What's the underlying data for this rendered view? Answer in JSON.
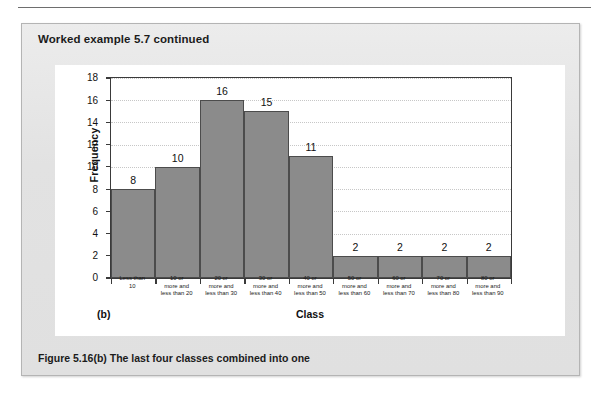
{
  "page": {
    "example_title": "Worked example 5.7 continued",
    "caption": "Figure 5.16(b)  The last four classes combined into one",
    "panel_letter": "(b)"
  },
  "chart_data": {
    "type": "bar",
    "title": "",
    "xlabel": "Class",
    "ylabel": "Frequency",
    "ylim": [
      0,
      18
    ],
    "yticks": [
      0,
      2,
      4,
      6,
      8,
      10,
      12,
      14,
      16,
      18
    ],
    "grid": true,
    "legend": "none",
    "categories": [
      "Less than\n10",
      "10 or\nmore and\nless than 20",
      "20 or\nmore and\nless than 30",
      "30 or\nmore and\nless than 40",
      "40 or\nmore and\nless than 50",
      "50 or\nmore and\nless than 60",
      "60 or\nmore and\nless than 70",
      "70 or\nmore and\nless than 80",
      "80 or\nmore and\nless than 90"
    ],
    "category_lines": [
      [
        "Less than",
        "10"
      ],
      [
        "10 or",
        "more and",
        "less than 20"
      ],
      [
        "20 or",
        "more and",
        "less than 30"
      ],
      [
        "30 or",
        "more and",
        "less than 40"
      ],
      [
        "40 or",
        "more and",
        "less than 50"
      ],
      [
        "50 or",
        "more and",
        "less than 60"
      ],
      [
        "60 or",
        "more and",
        "less than 70"
      ],
      [
        "70 or",
        "more and",
        "less than 80"
      ],
      [
        "80 or",
        "more and",
        "less than 90"
      ]
    ],
    "values": [
      8,
      10,
      16,
      15,
      11,
      2,
      2,
      2,
      2
    ],
    "bar_color": "#8b8b8b",
    "bar_edge_color": "#4c4c4c"
  }
}
